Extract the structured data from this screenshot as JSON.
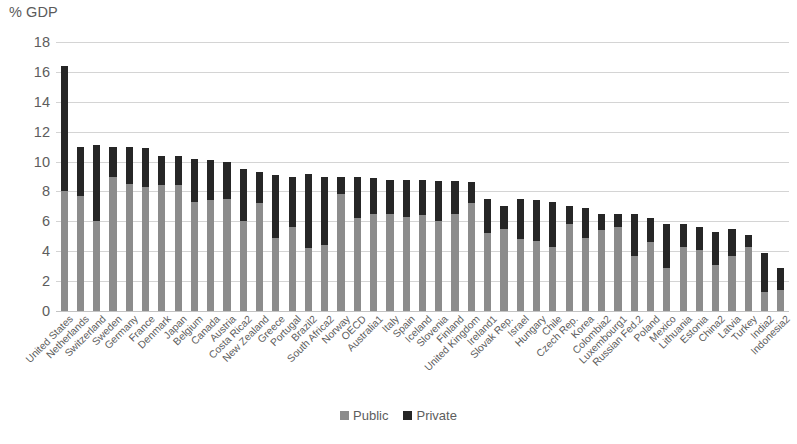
{
  "chart_data": {
    "type": "bar",
    "subtype": "stacked-column",
    "title": "",
    "xlabel": "",
    "ylabel": "% GDP",
    "ylim": [
      0,
      18
    ],
    "ytick_step": 2,
    "yticks": [
      "18",
      "16",
      "14",
      "12",
      "10",
      "8",
      "6",
      "4",
      "2",
      "0"
    ],
    "grid": true,
    "legend_position": "bottom-center",
    "categories": [
      "United States",
      "Netherlands",
      "Switzerland",
      "Sweden",
      "Germany",
      "France",
      "Denmark",
      "Japan",
      "Belgium",
      "Canada",
      "Austria",
      "Costa Rica2",
      "New Zealand",
      "Greece",
      "Portugal",
      "Brazil2",
      "South Africa2",
      "Norway",
      "OECD",
      "Australia1",
      "Italy",
      "Spain",
      "Iceland",
      "Slovenia",
      "Finland",
      "United Kingdom",
      "Ireland1",
      "Slovak Rep.",
      "Israel",
      "Hungary",
      "Chile",
      "Czech Rep.",
      "Korea",
      "Colombia2",
      "Luxembourg1",
      "Russian Fed.2",
      "Poland",
      "Mexico",
      "Lithuania",
      "Estonia",
      "China2",
      "Latvia",
      "Turkey",
      "India2",
      "Indonesia2"
    ],
    "series": [
      {
        "name": "Public",
        "color": "#8c8c8c",
        "values": [
          8.0,
          7.7,
          6.0,
          9.0,
          8.5,
          8.3,
          8.4,
          8.4,
          7.3,
          7.4,
          7.5,
          6.0,
          7.2,
          4.9,
          5.6,
          4.2,
          4.4,
          7.8,
          6.2,
          6.5,
          6.5,
          6.3,
          6.4,
          6.0,
          6.5,
          7.2,
          5.2,
          5.5,
          4.8,
          4.7,
          4.3,
          5.8,
          4.9,
          5.4,
          5.6,
          3.7,
          4.6,
          2.9,
          4.3,
          4.1,
          3.1,
          3.7,
          4.3,
          1.3,
          1.4
        ]
      },
      {
        "name": "Private",
        "color": "#262626",
        "values": [
          8.4,
          3.3,
          5.1,
          2.0,
          2.5,
          2.6,
          2.0,
          2.0,
          2.9,
          2.7,
          2.5,
          3.5,
          2.1,
          4.2,
          3.4,
          5.0,
          4.6,
          1.2,
          2.8,
          2.4,
          2.3,
          2.5,
          2.4,
          2.7,
          2.2,
          1.4,
          2.3,
          1.5,
          2.7,
          2.7,
          3.0,
          1.2,
          2.0,
          1.1,
          0.9,
          2.8,
          1.6,
          2.9,
          1.5,
          1.5,
          2.2,
          1.8,
          0.8,
          2.6,
          1.5
        ]
      }
    ],
    "totals": [
      16.4,
      11.0,
      11.1,
      11.0,
      11.0,
      10.9,
      10.4,
      10.4,
      10.2,
      10.1,
      10.0,
      9.5,
      9.3,
      9.1,
      9.0,
      9.2,
      9.0,
      9.0,
      9.0,
      8.9,
      8.8,
      8.8,
      8.8,
      8.7,
      8.7,
      8.6,
      7.5,
      7.0,
      7.5,
      7.4,
      7.3,
      7.0,
      6.9,
      6.5,
      6.5,
      6.5,
      6.2,
      5.8,
      5.8,
      5.6,
      5.3,
      5.5,
      5.1,
      3.9,
      2.9
    ]
  },
  "axis": {
    "y_title": "% GDP"
  },
  "legend": {
    "items": [
      {
        "label": "Public",
        "color": "#8c8c8c",
        "swatch": "square-gray"
      },
      {
        "label": "Private",
        "color": "#262626",
        "swatch": "square-black"
      }
    ]
  }
}
